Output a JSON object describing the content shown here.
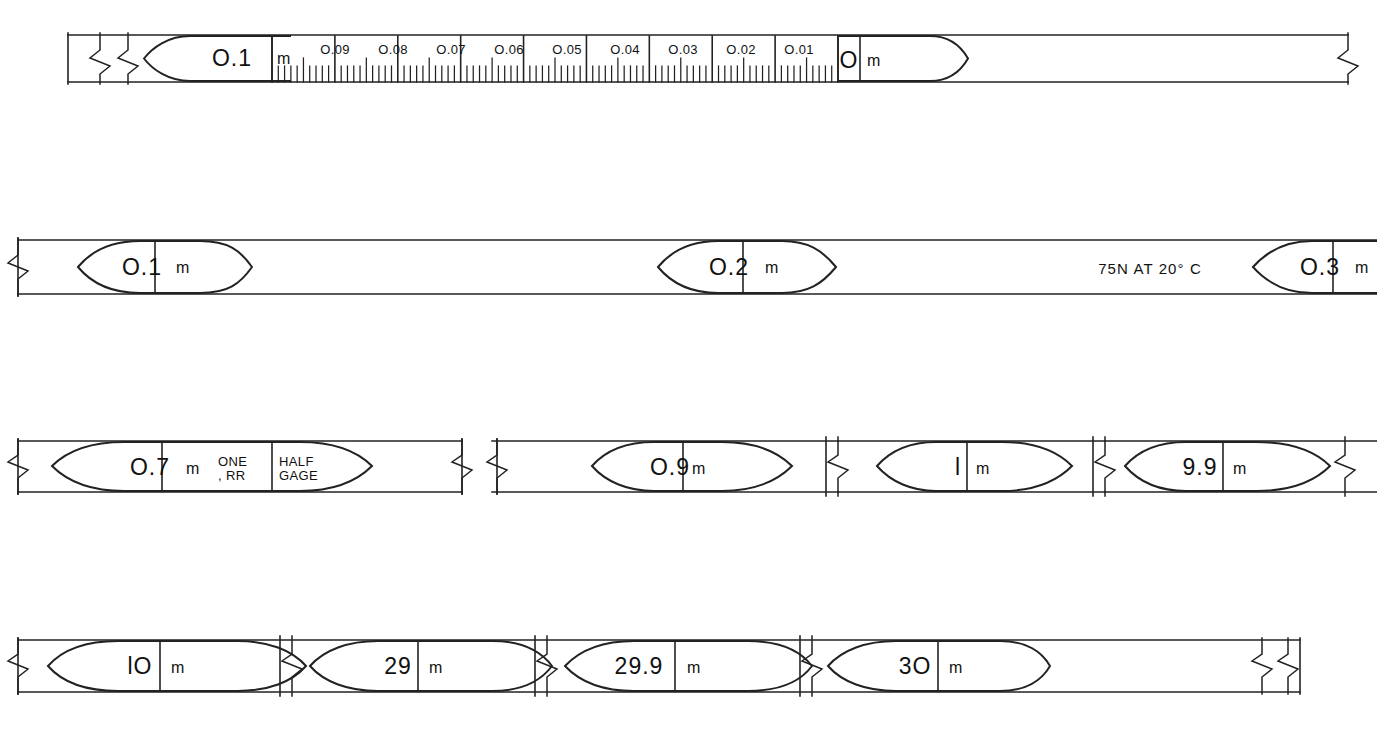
{
  "document": {
    "title": "Surveyor's Steel Tape Graduation Markings",
    "units": "metric",
    "tension_note": "75N AT 20° C"
  },
  "colors": {
    "ink": "#111111",
    "paper": "#ffffff",
    "rule": "#333333"
  },
  "rows": [
    {
      "id": "row-1",
      "name": "decimetre-detail-row",
      "y_top": 35,
      "y_bottom": 82,
      "x_start": 68,
      "x_end": 1348,
      "left_break": {
        "x": 100,
        "type": "break-symbol"
      },
      "left_break2": {
        "x": 128,
        "type": "break-symbol"
      },
      "right_break": {
        "x": 1348,
        "type": "break-symbol"
      },
      "markers": [
        {
          "label_value": "O.1",
          "label_unit": "m",
          "cx": 218,
          "shape": "lozenge-left-point",
          "x1": 152,
          "x2": 290,
          "divider_x": 272
        },
        {
          "label_value": "O",
          "label_unit": "m",
          "cx": 878,
          "shape": "lozenge-right-point",
          "x1": 838,
          "x2": 962,
          "divider_x": 860
        }
      ],
      "scale": {
        "from_x": 272,
        "to_x": 838,
        "tick_labels": [
          "O.09",
          "O.08",
          "O.07",
          "O.06",
          "O.05",
          "O.04",
          "O.03",
          "O.02",
          "O.01"
        ],
        "tick_label_x": [
          335,
          392,
          450,
          508,
          566,
          623,
          681,
          739,
          797
        ],
        "minor_per_division": 10,
        "division_count": 9
      }
    },
    {
      "id": "row-2",
      "name": "decimetre-row",
      "y_top": 240,
      "y_bottom": 294,
      "x_start": 18,
      "x_end": 1377,
      "left_break": {
        "x": 18,
        "type": "break-symbol"
      },
      "note": {
        "text": "75N AT 20° C",
        "cx": 1150
      },
      "markers": [
        {
          "label_value": "O.1",
          "label_unit": "m",
          "cx": 160,
          "x1": 78,
          "x2": 245,
          "divider_x": 155,
          "shape": "lozenge"
        },
        {
          "label_value": "O.2",
          "label_unit": "m",
          "cx": 740,
          "x1": 655,
          "x2": 845,
          "divider_x": 743,
          "shape": "lozenge"
        },
        {
          "label_value": "O.3",
          "label_unit": "m",
          "cx": 1330,
          "x1": 1253,
          "x2": 1377,
          "divider_x": 1333,
          "shape": "lozenge-left-point"
        }
      ]
    },
    {
      "id": "row-3",
      "name": "seven-to-nine-point-nine-row",
      "y_top": 441,
      "y_bottom": 492,
      "segments": [
        {
          "x_start": 18,
          "x_end": 462,
          "left_break": {
            "x": 18
          },
          "right_break": {
            "x": 462
          },
          "markers": [
            {
              "label_value": "O.7",
              "label_unit": "m",
              "cx": 168,
              "x1": 52,
              "x2": 370,
              "divider_x": 162,
              "shape": "lozenge",
              "extra_text": [
                {
                  "lines": [
                    "ONE",
                    ", RR"
                  ],
                  "cx": 243
                },
                {
                  "lines": [
                    "HALF",
                    "GAGE"
                  ],
                  "cx": 305
                }
              ],
              "extra_divider_x": 272
            }
          ]
        },
        {
          "x_start": 492,
          "x_end": 838,
          "left_break": {
            "x": 497
          },
          "right_break": {
            "x": 838
          },
          "markers": [
            {
              "label_value": "O.9",
              "label_unit": "m",
              "cx": 670,
              "x1": 592,
              "x2": 790,
              "divider_x": 683,
              "shape": "lozenge"
            }
          ]
        },
        {
          "x_start": 858,
          "x_end": 1105,
          "left_break": {
            "x": 1105
          },
          "markers": [
            {
              "label_value": "l",
              "label_unit": "m",
              "cx": 970,
              "x1": 877,
              "x2": 1073,
              "divider_x": 967,
              "shape": "lozenge"
            }
          ]
        },
        {
          "x_start": 1118,
          "x_end": 1377,
          "right_break": {
            "x": 1340
          },
          "markers": [
            {
              "label_value": "9.9",
              "label_unit": "m",
              "cx": 1215,
              "x1": 1125,
              "x2": 1330,
              "divider_x": 1223,
              "shape": "lozenge"
            }
          ]
        }
      ]
    },
    {
      "id": "row-4",
      "name": "ten-to-thirty-row",
      "y_top": 640,
      "y_bottom": 692,
      "x_start": 18,
      "x_end": 1300,
      "left_break": {
        "x": 18
      },
      "right_break": {
        "x": 1270
      },
      "inner_breaks": [
        290,
        545,
        810
      ],
      "markers": [
        {
          "label_value": "lO",
          "label_unit": "m",
          "cx": 148,
          "x1": 48,
          "x2": 268,
          "divider_x": 160,
          "shape": "lozenge"
        },
        {
          "label_value": "29",
          "label_unit": "m",
          "cx": 398,
          "x1": 310,
          "x2": 522,
          "divider_x": 418,
          "shape": "lozenge"
        },
        {
          "label_value": "29.9",
          "label_unit": "m",
          "cx": 648,
          "x1": 565,
          "x2": 785,
          "divider_x": 675,
          "shape": "lozenge"
        },
        {
          "label_value": "3O",
          "label_unit": "m",
          "cx": 913,
          "x1": 828,
          "x2": 1045,
          "divider_x": 938,
          "shape": "lozenge-right-point"
        }
      ]
    }
  ],
  "labels": {
    "r1_m0_value": "O.1",
    "r1_m0_unit": "m",
    "r1_m1_value": "O",
    "r1_m1_unit": "m",
    "r1_t0": "O.09",
    "r1_t1": "O.08",
    "r1_t2": "O.07",
    "r1_t3": "O.06",
    "r1_t4": "O.05",
    "r1_t5": "O.04",
    "r1_t6": "O.03",
    "r1_t7": "O.02",
    "r1_t8": "O.01",
    "r2_m0_value": "O.1",
    "r2_m0_unit": "m",
    "r2_m1_value": "O.2",
    "r2_m1_unit": "m",
    "r2_m2_value": "O.3",
    "r2_m2_unit": "m",
    "r2_note": "75N AT 20° C",
    "r3_m0_value": "O.7",
    "r3_m0_unit": "m",
    "r3_x0a": "ONE",
    "r3_x0b": ", RR",
    "r3_x1a": "HALF",
    "r3_x1b": "GAGE",
    "r3_m1_value": "O.9",
    "r3_m1_unit": "m",
    "r3_m2_value": "l",
    "r3_m2_unit": "m",
    "r3_m3_value": "9.9",
    "r3_m3_unit": "m",
    "r4_m0_value": "lO",
    "r4_m0_unit": "m",
    "r4_m1_value": "29",
    "r4_m1_unit": "m",
    "r4_m2_value": "29.9",
    "r4_m2_unit": "m",
    "r4_m3_value": "3O",
    "r4_m3_unit": "m"
  }
}
